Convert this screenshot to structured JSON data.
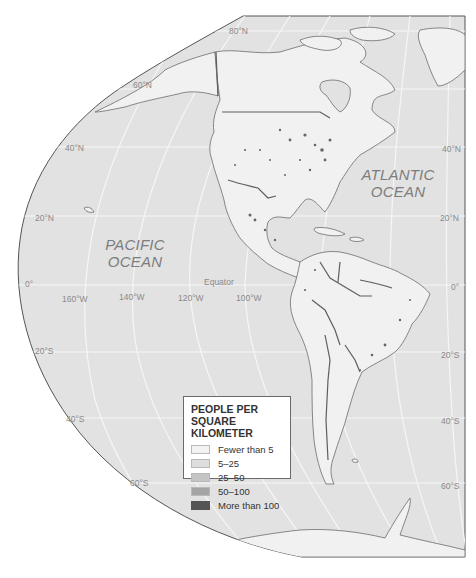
{
  "map": {
    "title": "People per square kilometer — The Americas",
    "colors": {
      "page_background": "#ffffff",
      "ocean": "#e2e2e2",
      "land": "#f1f1f1",
      "graticule": "#f7f7f7",
      "border": "#5e5e5e",
      "coastline": "#6c6c6c"
    }
  },
  "oceans": {
    "pacific": {
      "line1": "PACIFIC",
      "line2": "OCEAN"
    },
    "atlantic": {
      "line1": "ATLANTIC",
      "line2": "OCEAN"
    }
  },
  "graticule_labels": {
    "lat_80n": "80°N",
    "lat_60n": "60°N",
    "lat_40n_left": "40°N",
    "lat_40n_right": "40°N",
    "lat_20n_left": "20°N",
    "lat_20n_right": "20°N",
    "lat_0_left": "0°",
    "lat_0_right": "0°",
    "equator": "Equator",
    "lat_20s_left": "20°S",
    "lat_20s_right": "20°S",
    "lat_40s_left": "40°S",
    "lat_40s_right": "40°S",
    "lat_60s_left": "60°S",
    "lat_60s_right": "60°S",
    "lon_160w": "160°W",
    "lon_140w": "140°W",
    "lon_120w": "120°W",
    "lon_100w": "100°W"
  },
  "legend": {
    "title_line1": "PEOPLE PER",
    "title_line2": "SQUARE KILOMETER",
    "items": [
      {
        "label": "Fewer than 5",
        "color": "#f3f3f3"
      },
      {
        "label": "5–25",
        "color": "#dedede"
      },
      {
        "label": "25–50",
        "color": "#c4c4c4"
      },
      {
        "label": "50–100",
        "color": "#a4a4a4"
      },
      {
        "label": "More than 100",
        "color": "#555555"
      }
    ]
  }
}
